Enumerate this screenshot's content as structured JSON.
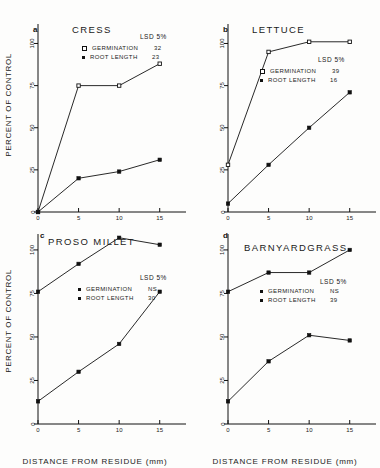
{
  "figure": {
    "axis": {
      "xlabel": "DISTANCE FROM RESIDUE  (mm)",
      "ylabel": "PERCENT OF CONTROL",
      "xticks": [
        "0",
        "5",
        "10",
        "15"
      ],
      "yticks": [
        "0",
        "25",
        "50",
        "75",
        "100"
      ],
      "xlim": [
        0,
        17.5
      ],
      "ylim": [
        0,
        108
      ]
    },
    "legend_headers": {
      "lsd": "LSD  5%",
      "germination": "GERMINATION",
      "root_length": "ROOT LENGTH"
    },
    "colors": {
      "line": "#111111",
      "marker_filled": "#111111",
      "marker_open": "#ffffff",
      "background": "#fdfdfc"
    }
  },
  "chart_data": [
    {
      "type": "line",
      "panel": "a",
      "title": "CRESS",
      "xlabel": "DISTANCE FROM RESIDUE  (mm)",
      "ylabel": "PERCENT OF CONTROL",
      "x": [
        0,
        5,
        10,
        15
      ],
      "xlim": [
        0,
        17.5
      ],
      "ylim": [
        0,
        108
      ],
      "grid": false,
      "lsd_label": "LSD  5%",
      "series": [
        {
          "name": "GERMINATION",
          "marker": "open-square",
          "lsd": "32",
          "values": [
            0,
            75,
            75,
            88
          ]
        },
        {
          "name": "ROOT LENGTH",
          "marker": "filled-square",
          "lsd": "23",
          "values": [
            0,
            20,
            24,
            31
          ]
        }
      ]
    },
    {
      "type": "line",
      "panel": "b",
      "title": "LETTUCE",
      "xlabel": "DISTANCE FROM RESIDUE  (mm)",
      "ylabel": "PERCENT OF CONTROL",
      "x": [
        0,
        5,
        10,
        15
      ],
      "xlim": [
        0,
        17.5
      ],
      "ylim": [
        0,
        108
      ],
      "grid": false,
      "lsd_label": "LSD  5%",
      "series": [
        {
          "name": "GERMINATION",
          "marker": "open-square",
          "lsd": "39",
          "values": [
            28,
            95,
            101,
            101
          ]
        },
        {
          "name": "ROOT LENGTH",
          "marker": "filled-square",
          "lsd": "16",
          "values": [
            5,
            28,
            50,
            71
          ]
        }
      ]
    },
    {
      "type": "line",
      "panel": "c",
      "title": "PROSO  MILLET",
      "xlabel": "DISTANCE FROM RESIDUE  (mm)",
      "ylabel": "PERCENT OF CONTROL",
      "x": [
        0,
        5,
        10,
        15
      ],
      "xlim": [
        0,
        17.5
      ],
      "ylim": [
        0,
        108
      ],
      "grid": false,
      "lsd_label": "LSD  5%",
      "series": [
        {
          "name": "GERMINATION",
          "marker": "filled-square",
          "lsd": "NS",
          "values": [
            76,
            92,
            107,
            103
          ]
        },
        {
          "name": "ROOT LENGTH",
          "marker": "filled-square",
          "lsd": "30",
          "values": [
            13,
            30,
            46,
            76
          ]
        }
      ]
    },
    {
      "type": "line",
      "panel": "d",
      "title": "BARNYARDGRASS",
      "xlabel": "DISTANCE FROM RESIDUE  (mm)",
      "ylabel": "PERCENT OF CONTROL",
      "x": [
        0,
        5,
        10,
        15
      ],
      "xlim": [
        0,
        17.5
      ],
      "ylim": [
        0,
        108
      ],
      "grid": false,
      "lsd_label": "LSD  5%",
      "series": [
        {
          "name": "GERMINATION",
          "marker": "filled-square",
          "lsd": "NS",
          "values": [
            76,
            87,
            87,
            100
          ]
        },
        {
          "name": "ROOT LENGTH",
          "marker": "filled-square",
          "lsd": "39",
          "values": [
            13,
            36,
            51,
            48
          ]
        }
      ]
    }
  ],
  "panel_letters": {
    "a": "a",
    "b": "b",
    "c": "c",
    "d": "d"
  }
}
